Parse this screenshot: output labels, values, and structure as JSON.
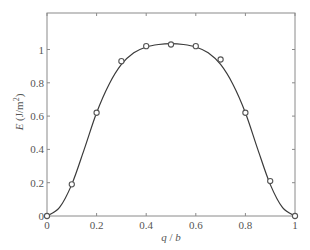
{
  "chart_data": {
    "type": "line",
    "title": "",
    "xlabel": "q / b",
    "xlabel_parts": {
      "q": "q",
      "sep": " / ",
      "b": "b"
    },
    "ylabel": "E (J/m²)",
    "ylabel_parts": {
      "var": "E",
      "unit": " (J/m",
      "sup": "2",
      "close": ")"
    },
    "xlim": [
      0,
      1
    ],
    "ylim": [
      0,
      1.2
    ],
    "xticks": [
      0,
      0.2,
      0.4,
      0.6,
      0.8,
      1
    ],
    "xtick_labels": [
      "0",
      "0.2",
      "0.4",
      "0.6",
      "0.8",
      "1"
    ],
    "yticks": [
      0,
      0.2,
      0.4,
      0.6,
      0.8,
      1
    ],
    "ytick_labels": [
      "0",
      "0.2",
      "0.4",
      "0.6",
      "0.8",
      "1"
    ],
    "grid": false,
    "legend": null,
    "series": [
      {
        "name": "calculated points",
        "style": "markers",
        "marker": "open-circle",
        "x": [
          0,
          0.1,
          0.2,
          0.3,
          0.4,
          0.5,
          0.6,
          0.7,
          0.8,
          0.9,
          1.0
        ],
        "y": [
          0,
          0.19,
          0.62,
          0.93,
          1.02,
          1.03,
          1.02,
          0.94,
          0.62,
          0.21,
          0
        ]
      },
      {
        "name": "fitted curve",
        "style": "line",
        "x": [
          0,
          0.05,
          0.1,
          0.15,
          0.2,
          0.25,
          0.3,
          0.35,
          0.4,
          0.45,
          0.5,
          0.55,
          0.6,
          0.65,
          0.7,
          0.75,
          0.8,
          0.85,
          0.9,
          0.95,
          1.0
        ],
        "y": [
          0,
          0.05,
          0.19,
          0.4,
          0.62,
          0.79,
          0.91,
          0.98,
          1.015,
          1.03,
          1.035,
          1.03,
          1.015,
          0.98,
          0.91,
          0.79,
          0.62,
          0.4,
          0.19,
          0.05,
          0
        ]
      }
    ]
  },
  "style": {
    "axis_color": "#8a8a8a",
    "line_color": "#3a3a3a",
    "marker_color": "#555555"
  }
}
